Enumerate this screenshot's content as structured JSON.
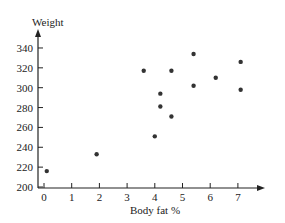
{
  "chart_data": {
    "type": "scatter",
    "title": "",
    "xlabel": "Body fat %",
    "ylabel": "Weight",
    "xlim": [
      0,
      7.5
    ],
    "ylim": [
      200,
      350
    ],
    "xticks": [
      0,
      1,
      2,
      3,
      4,
      5,
      6,
      7
    ],
    "yticks": [
      200,
      220,
      240,
      260,
      280,
      300,
      320,
      340
    ],
    "grid": false,
    "legend": null,
    "points": [
      {
        "x": 0.1,
        "y": 216
      },
      {
        "x": 1.9,
        "y": 233
      },
      {
        "x": 3.6,
        "y": 317
      },
      {
        "x": 4.0,
        "y": 251
      },
      {
        "x": 4.2,
        "y": 294
      },
      {
        "x": 4.2,
        "y": 281
      },
      {
        "x": 4.6,
        "y": 317
      },
      {
        "x": 4.6,
        "y": 271
      },
      {
        "x": 5.4,
        "y": 334
      },
      {
        "x": 5.4,
        "y": 302
      },
      {
        "x": 6.2,
        "y": 310
      },
      {
        "x": 7.1,
        "y": 326
      },
      {
        "x": 7.1,
        "y": 298
      }
    ]
  }
}
